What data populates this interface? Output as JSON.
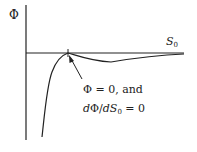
{
  "diagram": {
    "y_axis_label": "Φ",
    "x_axis_label_main": "S",
    "x_axis_label_sub": "0",
    "annotation_line1": "Φ = 0, and",
    "annotation_line2_d1": "d",
    "annotation_line2_phi": "Φ/",
    "annotation_line2_d2": "d",
    "annotation_line2_s": "S",
    "annotation_line2_sub": "0",
    "annotation_line2_rest": " = 0",
    "colors": {
      "ink": "#222222",
      "background": "#ffffff"
    }
  }
}
